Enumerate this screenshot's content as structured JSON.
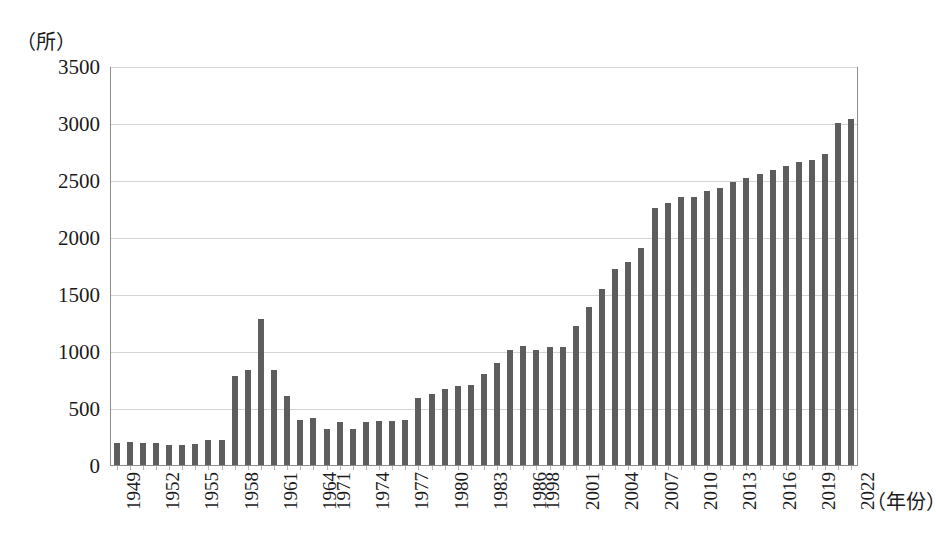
{
  "chart_data": {
    "type": "bar",
    "title": "",
    "subtitle": "",
    "xlabel": "（年份）",
    "ylabel": "（所）",
    "ylim": [
      0,
      3500
    ],
    "ytick_step": 500,
    "yticks": [
      "0",
      "500",
      "1000",
      "1500",
      "2000",
      "2500",
      "3000",
      "3500"
    ],
    "grid": "horizontal",
    "legend": "none",
    "bar_color": "#5d5d5d",
    "gridline_color": "#d3d3d3",
    "axis_color": "#8d8d8d",
    "xtick_labels_shown": [
      "1949",
      "1952",
      "1955",
      "1958",
      "1961",
      "1964",
      "1971",
      "1974",
      "1977",
      "1980",
      "1983",
      "1986",
      "1998",
      "2001",
      "2004",
      "2007",
      "2010",
      "2013",
      "2016",
      "2019",
      "2022"
    ],
    "note_gaps": [
      "1965-1970 not plotted",
      "1987-1997 not plotted"
    ],
    "categories": [
      "1949",
      "1950",
      "1951",
      "1952",
      "1953",
      "1954",
      "1955",
      "1956",
      "1957",
      "1958",
      "1959",
      "1960",
      "1961",
      "1962",
      "1963",
      "1964",
      "1971",
      "1972",
      "1973",
      "1974",
      "1975",
      "1976",
      "1977",
      "1978",
      "1979",
      "1980",
      "1981",
      "1982",
      "1983",
      "1984",
      "1985",
      "1986",
      "1998",
      "1999",
      "2000",
      "2001",
      "2002",
      "2003",
      "2004",
      "2005",
      "2006",
      "2007",
      "2008",
      "2009",
      "2010",
      "2011",
      "2012",
      "2013",
      "2014",
      "2015",
      "2016",
      "2017",
      "2018",
      "2019",
      "2020",
      "2021",
      "2022"
    ],
    "values": [
      205,
      207,
      206,
      201,
      181,
      188,
      194,
      227,
      229,
      791,
      841,
      1289,
      845,
      610,
      407,
      419,
      328,
      388,
      328,
      388,
      392,
      392,
      404,
      598,
      633,
      675,
      704,
      715,
      805,
      902,
      1016,
      1054,
      1022,
      1041,
      1041,
      1225,
      1396,
      1552,
      1731,
      1792,
      1909,
      2263,
      2305,
      2358,
      2358,
      2409,
      2442,
      2491,
      2529,
      2560,
      2596,
      2631,
      2663,
      2688,
      2740,
      3012,
      3044
    ]
  },
  "axis": {
    "y_unit": "（所）",
    "x_title": "（年份）"
  }
}
